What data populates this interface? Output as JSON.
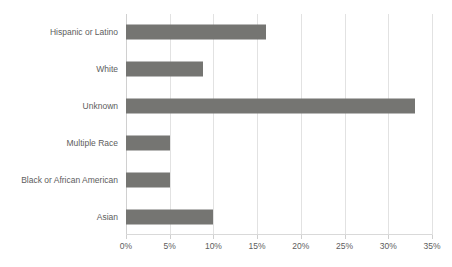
{
  "chart_data": {
    "type": "bar",
    "orientation": "horizontal",
    "title": "",
    "subtitle": "",
    "xlabel": "",
    "ylabel": "",
    "categories": [
      "Hispanic or Latino",
      "White",
      "Unknown",
      "Multiple Race",
      "Black or African American",
      "Asian"
    ],
    "values": [
      16,
      8.8,
      33,
      5,
      5,
      10
    ],
    "value_labels": [
      "16%",
      "8.8%",
      "33%",
      "5%",
      "5%",
      "10%"
    ],
    "xlim": [
      0,
      35
    ],
    "x_ticks": [
      0,
      5,
      10,
      15,
      20,
      25,
      30,
      35
    ],
    "x_tick_labels": [
      "0%",
      "5%",
      "10%",
      "15%",
      "20%",
      "25%",
      "30%",
      "35%"
    ],
    "grid": "vertical",
    "legend": "none",
    "series": [
      {
        "name": "Percent",
        "values": [
          16,
          8.8,
          33,
          5,
          5,
          10
        ]
      }
    ]
  },
  "colors": {
    "bar": "#757572",
    "gridline": "#e2e2e2",
    "axis": "#d9d9d9",
    "text": "#5d5d5d",
    "background": "#ffffff"
  },
  "caption": {
    "text": ""
  }
}
